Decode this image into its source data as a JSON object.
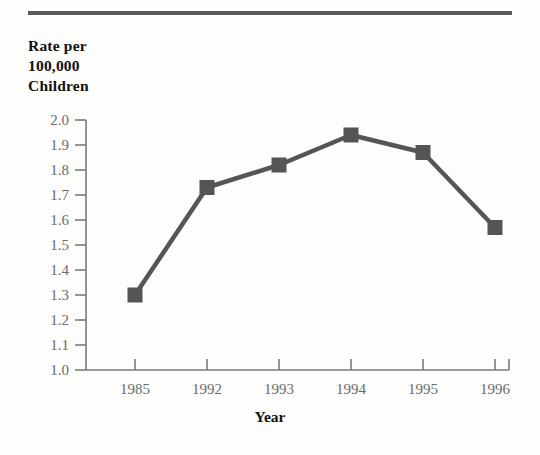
{
  "figure": {
    "background_color": "#fdfdfc",
    "ink_color": "#555555",
    "rule_color": "#5a5a5a",
    "tick_label_color": "#6b6b6b",
    "title_color": "#111111"
  },
  "y_axis_title_lines": [
    "Rate per",
    "100,000",
    "Children"
  ],
  "x_axis_title": "Year",
  "chart_data": {
    "type": "line",
    "title": "",
    "subtitle": "",
    "xlabel": "Year",
    "ylabel": "Rate per 100,000 Children",
    "categories": [
      "1985",
      "1992",
      "1993",
      "1994",
      "1995",
      "1996"
    ],
    "values": [
      1.3,
      1.73,
      1.82,
      1.94,
      1.87,
      1.57
    ],
    "series": [
      {
        "name": "Rate per 100,000 Children",
        "values": [
          1.3,
          1.73,
          1.82,
          1.94,
          1.87,
          1.57
        ],
        "color": "#555555",
        "marker": "square"
      }
    ],
    "ylim": [
      1.0,
      2.0
    ],
    "ytick_labels": [
      "1.0",
      "1.1",
      "1.2",
      "1.3",
      "1.4",
      "1.5",
      "1.6",
      "1.7",
      "1.8",
      "1.9",
      "2.0"
    ],
    "ytick_values": [
      1.0,
      1.1,
      1.2,
      1.3,
      1.4,
      1.5,
      1.6,
      1.7,
      1.8,
      1.9,
      2.0
    ],
    "xtick_labels": [
      "1985",
      "1992",
      "1993",
      "1994",
      "1995",
      "1996"
    ],
    "grid": false,
    "legend": "none",
    "annotations": []
  }
}
